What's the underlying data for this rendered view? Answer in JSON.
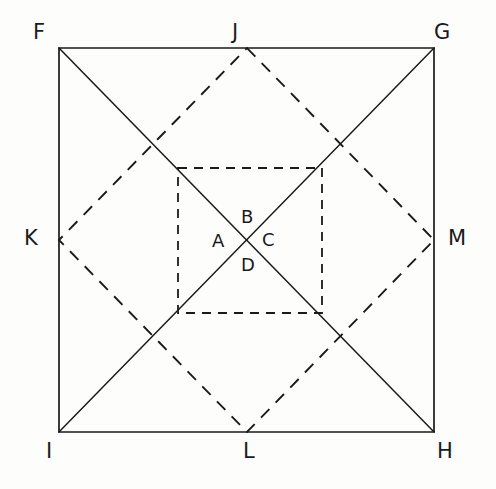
{
  "figure": {
    "canvas": {
      "width": 496,
      "height": 489
    },
    "colors": {
      "background": "#fdfdfc",
      "stroke_solid": "#1a1a1a",
      "stroke_dashed": "#1a1a1a",
      "label": "#1a1a1a"
    },
    "stroke": {
      "solid_width": 1.6,
      "dashed_width": 1.8,
      "dash_pattern_long": "11 9",
      "dash_pattern_short": "7 6"
    },
    "outer_square": {
      "name": "outer-square",
      "style": "solid",
      "corners": [
        {
          "label": "F",
          "x": 59,
          "y": 48
        },
        {
          "label": "G",
          "x": 434,
          "y": 48
        },
        {
          "label": "H",
          "x": 434,
          "y": 432
        },
        {
          "label": "I",
          "x": 59,
          "y": 432
        }
      ],
      "path": "M 59 48 L 434 48 L 434 432 L 59 432 Z"
    },
    "diagonals": {
      "name": "square-diagonals",
      "style": "solid",
      "lines": [
        {
          "id": "F-H",
          "from": "F",
          "to": "H",
          "path": "M 59 48 L 434 432"
        },
        {
          "id": "G-I",
          "from": "G",
          "to": "I",
          "path": "M 434 48 L 59 432"
        }
      ],
      "intersection": {
        "x": 247,
        "y": 240
      }
    },
    "diamond": {
      "name": "inscribed-diamond",
      "style": "dashed",
      "description": "Rotated square joining midpoints of the outer square's sides",
      "vertices": [
        {
          "label": "J",
          "x": 247,
          "y": 48,
          "side": "top"
        },
        {
          "label": "M",
          "x": 434,
          "y": 240,
          "side": "right"
        },
        {
          "label": "L",
          "x": 247,
          "y": 432,
          "side": "bottom"
        },
        {
          "label": "K",
          "x": 59,
          "y": 240,
          "side": "left"
        }
      ],
      "path": "M 247 48 L 434 240 L 247 432 L 59 240 Z"
    },
    "inner_square": {
      "name": "inner-square",
      "style": "dashed",
      "description": "Small axis-aligned dashed square centred on the diagonal intersection",
      "corners": [
        {
          "x": 178,
          "y": 168
        },
        {
          "x": 322,
          "y": 168
        },
        {
          "x": 322,
          "y": 313
        },
        {
          "x": 178,
          "y": 313
        }
      ],
      "path": "M 178 168 L 322 168 L 322 313 L 178 313 Z"
    },
    "labels": {
      "outer": [
        {
          "text": "F",
          "x": 33,
          "y": 22,
          "name": "vertex-label-F"
        },
        {
          "text": "J",
          "x": 232,
          "y": 22,
          "name": "vertex-label-J"
        },
        {
          "text": "G",
          "x": 434,
          "y": 22,
          "name": "vertex-label-G"
        },
        {
          "text": "K",
          "x": 24,
          "y": 228,
          "name": "vertex-label-K"
        },
        {
          "text": "M",
          "x": 448,
          "y": 228,
          "name": "vertex-label-M"
        },
        {
          "text": "I",
          "x": 46,
          "y": 441,
          "name": "vertex-label-I"
        },
        {
          "text": "L",
          "x": 243,
          "y": 441,
          "name": "vertex-label-L"
        },
        {
          "text": "H",
          "x": 437,
          "y": 441,
          "name": "vertex-label-H"
        }
      ],
      "center": [
        {
          "text": "A",
          "x": 212,
          "y": 232,
          "name": "region-label-A"
        },
        {
          "text": "B",
          "x": 241,
          "y": 208,
          "name": "region-label-B"
        },
        {
          "text": "C",
          "x": 262,
          "y": 231,
          "name": "region-label-C"
        },
        {
          "text": "D",
          "x": 241,
          "y": 256,
          "name": "region-label-D"
        }
      ]
    }
  }
}
